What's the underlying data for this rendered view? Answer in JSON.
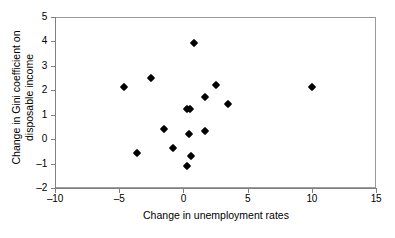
{
  "chart_data": {
    "type": "scatter",
    "title": "",
    "xlabel": "Change in unemployment rates",
    "ylabel_line1": "Change in Gini coefficient on",
    "ylabel_line2": "disposable income",
    "xlim": [
      -10,
      15
    ],
    "ylim": [
      -2,
      5
    ],
    "xticks": [
      -10,
      -5,
      0,
      5,
      10,
      15
    ],
    "xtick_labels": [
      "-10",
      "-5",
      "0",
      "5",
      "10",
      "15"
    ],
    "yticks": [
      -2,
      -1,
      0,
      1,
      2,
      3,
      4,
      5
    ],
    "ytick_labels": [
      "-2",
      "-1",
      "0",
      "1",
      "2",
      "3",
      "4",
      "5"
    ],
    "grid": false,
    "legend": false,
    "marker": "diamond",
    "marker_color": "#000000",
    "points": [
      {
        "x": -4.6,
        "y": 2.12
      },
      {
        "x": -2.5,
        "y": 2.51
      },
      {
        "x": -3.6,
        "y": -0.58
      },
      {
        "x": -1.5,
        "y": 0.42
      },
      {
        "x": -0.8,
        "y": -0.38
      },
      {
        "x": 0.25,
        "y": 1.25
      },
      {
        "x": 0.55,
        "y": 1.25
      },
      {
        "x": 0.45,
        "y": 0.21
      },
      {
        "x": 0.3,
        "y": -1.11
      },
      {
        "x": 0.6,
        "y": -0.67
      },
      {
        "x": 0.85,
        "y": 3.92
      },
      {
        "x": 1.7,
        "y": 1.73
      },
      {
        "x": 1.65,
        "y": 0.33
      },
      {
        "x": 2.5,
        "y": 2.21
      },
      {
        "x": 3.5,
        "y": 1.44
      },
      {
        "x": 10.0,
        "y": 2.12
      }
    ]
  }
}
